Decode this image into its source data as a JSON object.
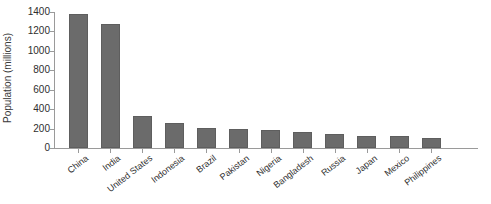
{
  "chart_data": {
    "type": "bar",
    "title": "",
    "xlabel": "",
    "ylabel": "Population (millions)",
    "ylim": [
      0,
      1400
    ],
    "yticks": [
      0,
      200,
      400,
      600,
      800,
      1000,
      1200,
      1400
    ],
    "ytick_labels": [
      "0",
      "200",
      "400",
      "600",
      "800",
      "1000",
      "1200",
      "1400"
    ],
    "grid": false,
    "legend": false,
    "bar_color": "#6b6b6b",
    "background_color": "#ffffff",
    "categories": [
      "China",
      "India",
      "United States",
      "Indonesia",
      "Brazil",
      "Pakistan",
      "Nigeria",
      "Bangladesh",
      "Russia",
      "Japan",
      "Mexico",
      "Philippines"
    ],
    "values": [
      1380,
      1280,
      330,
      255,
      205,
      198,
      190,
      165,
      145,
      127,
      122,
      100
    ]
  }
}
